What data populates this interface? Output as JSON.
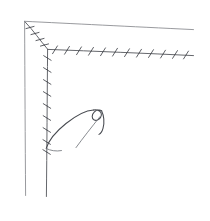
{
  "scene": {
    "title": "Barbed wire fence corner",
    "medium": "pen line drawing",
    "background_color": "#ffffff",
    "ink_color": "#4b4d52",
    "rail_color": "#8d8f93",
    "width": 210,
    "height": 221
  },
  "elements": {
    "top_rail": {
      "name": "top fence rail",
      "path": "M 24.5 21.5 L 193 29.5",
      "color": "#8d8f93"
    },
    "left_rail": {
      "name": "left fence rail",
      "path": "M 24.5 21.5 L 25.5 195",
      "color": "#8d8f93"
    },
    "top_wire": {
      "name": "top barbed wire strand",
      "path": "M 48 49.5 L 193 55.5",
      "color": "#5d5f64",
      "barb_count": 12,
      "barb_spacing_px": 12.5
    },
    "left_wire": {
      "name": "left barbed wire strand",
      "path": "M 47.5 49.5 L 46.5 196",
      "color": "#5d5f64",
      "barb_count": 9,
      "barb_spacing_px": 12
    },
    "diagonal_wire": {
      "name": "corner diagonal barbed wire",
      "path": "M 25.5 22.5 L 48 49.5",
      "color": "#5d5f64",
      "barb_count": 4
    },
    "loose_wire": {
      "name": "loose curled wire with twisted loop",
      "color": "#474a50",
      "loop_center": [
        97,
        120
      ],
      "attach_point": [
        46,
        148
      ]
    }
  },
  "barbs": {
    "top": [
      {
        "x": 55,
        "y": 49.8
      },
      {
        "x": 67,
        "y": 50.3
      },
      {
        "x": 79,
        "y": 50.8
      },
      {
        "x": 91,
        "y": 51.3
      },
      {
        "x": 103,
        "y": 51.8
      },
      {
        "x": 115,
        "y": 52.2
      },
      {
        "x": 127,
        "y": 52.7
      },
      {
        "x": 139,
        "y": 53.2
      },
      {
        "x": 151,
        "y": 53.6
      },
      {
        "x": 163,
        "y": 54.1
      },
      {
        "x": 175,
        "y": 54.5
      },
      {
        "x": 186,
        "y": 55.0
      }
    ],
    "left": [
      {
        "x": 47.4,
        "y": 58
      },
      {
        "x": 47.3,
        "y": 70
      },
      {
        "x": 47.2,
        "y": 82
      },
      {
        "x": 47.1,
        "y": 94
      },
      {
        "x": 47.0,
        "y": 106
      },
      {
        "x": 46.9,
        "y": 118
      },
      {
        "x": 46.8,
        "y": 130
      },
      {
        "x": 46.7,
        "y": 142
      },
      {
        "x": 46.6,
        "y": 152
      }
    ],
    "diagonal": [
      {
        "x": 30,
        "y": 27.5
      },
      {
        "x": 35,
        "y": 33.5
      },
      {
        "x": 40,
        "y": 39.5
      },
      {
        "x": 44.5,
        "y": 45
      }
    ]
  }
}
